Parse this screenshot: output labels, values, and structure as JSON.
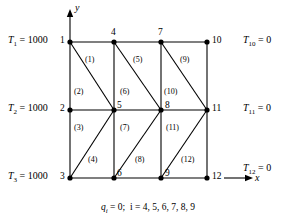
{
  "figure": {
    "axes": {
      "x_label": "x",
      "y_label": "y"
    },
    "caption": {
      "symbol": "q",
      "subscript": "i",
      "text_after_symbol": " = 0;",
      "index_text": "i = 4, 5, 6, 7, 8, 9",
      "full": "q_i = 0;  i = 4, 5, 6, 7, 8, 9"
    },
    "geometry": {
      "columns_x": [
        70,
        114,
        161,
        207
      ],
      "rows_y": [
        42,
        110,
        178
      ],
      "line_color": "#000000"
    },
    "nodes": [
      {
        "id": "1",
        "label": "1",
        "x": 70,
        "y": 42,
        "label_x": 60,
        "label_y": 36
      },
      {
        "id": "2",
        "label": "2",
        "x": 70,
        "y": 110,
        "label_x": 60,
        "label_y": 104
      },
      {
        "id": "3",
        "label": "3",
        "x": 70,
        "y": 178,
        "label_x": 60,
        "label_y": 172
      },
      {
        "id": "4",
        "label": "4",
        "x": 114,
        "y": 42,
        "label_x": 110,
        "label_y": 29
      },
      {
        "id": "5",
        "label": "5",
        "x": 114,
        "y": 110,
        "label_x": 117,
        "label_y": 103
      },
      {
        "id": "6",
        "label": "6",
        "x": 114,
        "y": 178,
        "label_x": 117,
        "label_y": 171
      },
      {
        "id": "7",
        "label": "7",
        "x": 161,
        "y": 42,
        "label_x": 157,
        "label_y": 29
      },
      {
        "id": "8",
        "label": "8",
        "x": 161,
        "y": 110,
        "label_x": 165,
        "label_y": 103
      },
      {
        "id": "9",
        "label": "9",
        "x": 161,
        "y": 178,
        "label_x": 165,
        "label_y": 171
      },
      {
        "id": "10",
        "label": "10",
        "x": 207,
        "y": 42,
        "label_x": 212,
        "label_y": 36
      },
      {
        "id": "11",
        "label": "11",
        "x": 207,
        "y": 110,
        "label_x": 212,
        "label_y": 104
      },
      {
        "id": "12",
        "label": "12",
        "x": 207,
        "y": 178,
        "label_x": 212,
        "label_y": 172
      }
    ],
    "elements": [
      {
        "id": "1",
        "label": "(1)",
        "x": 92,
        "y": 60
      },
      {
        "id": "2",
        "label": "(2)",
        "x": 80,
        "y": 92
      },
      {
        "id": "3",
        "label": "(3)",
        "x": 80,
        "y": 128
      },
      {
        "id": "4",
        "label": "(4)",
        "x": 94,
        "y": 160
      },
      {
        "id": "5",
        "label": "(5)",
        "x": 140,
        "y": 60
      },
      {
        "id": "6",
        "label": "(6)",
        "x": 126,
        "y": 92
      },
      {
        "id": "7",
        "label": "(7)",
        "x": 126,
        "y": 128
      },
      {
        "id": "8",
        "label": "(8)",
        "x": 141,
        "y": 160
      },
      {
        "id": "9",
        "label": "(9)",
        "x": 186,
        "y": 60
      },
      {
        "id": "10",
        "label": "(10)",
        "x": 170,
        "y": 92
      },
      {
        "id": "11",
        "label": "(11)",
        "x": 172,
        "y": 128
      },
      {
        "id": "12",
        "label": "(12)",
        "x": 187,
        "y": 160
      }
    ],
    "boundary_conditions_left": [
      {
        "symbol": "T",
        "sub": "1",
        "value": "1000",
        "text": "T1 = 1000",
        "x": 8,
        "y": 36
      },
      {
        "symbol": "T",
        "sub": "2",
        "value": "1000",
        "text": "T2 = 1000",
        "x": 8,
        "y": 104
      },
      {
        "symbol": "T",
        "sub": "3",
        "value": "1000",
        "text": "T3 = 1000",
        "x": 8,
        "y": 172
      }
    ],
    "boundary_conditions_right": [
      {
        "symbol": "T",
        "sub": "10",
        "value": "0",
        "text": "T10 = 0",
        "x": 243,
        "y": 36
      },
      {
        "symbol": "T",
        "sub": "11",
        "value": "0",
        "text": "T11 = 0",
        "x": 243,
        "y": 104
      },
      {
        "symbol": "T",
        "sub": "12",
        "value": "0",
        "text": "T12 = 0",
        "x": 243,
        "y": 164
      }
    ]
  }
}
